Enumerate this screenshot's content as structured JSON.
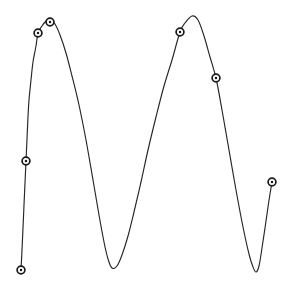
{
  "chart_data": {
    "type": "line",
    "title": "",
    "subtitle": "",
    "xlabel": "",
    "ylabel": "",
    "xlim": [
      0,
      294
    ],
    "ylim": [
      0,
      289
    ],
    "grid": false,
    "axes_visible": false,
    "tick_labels_x": [],
    "tick_labels_y": [],
    "legend": [],
    "legend_position": "none",
    "annotations": [],
    "series": [
      {
        "name": "waveform",
        "color": "#262626",
        "line_width": 1.15,
        "marker_shape": "circle-ring",
        "marker_size": 5,
        "points": [
          {
            "x": 21,
            "y": 270
          },
          {
            "x": 22,
            "y": 250
          },
          {
            "x": 23,
            "y": 228
          },
          {
            "x": 24,
            "y": 205
          },
          {
            "x": 25,
            "y": 183
          },
          {
            "x": 26,
            "y": 161
          },
          {
            "x": 27,
            "y": 139
          },
          {
            "x": 28,
            "y": 117
          },
          {
            "x": 29,
            "y": 100
          },
          {
            "x": 31,
            "y": 80
          },
          {
            "x": 33,
            "y": 62
          },
          {
            "x": 36,
            "y": 46
          },
          {
            "x": 38,
            "y": 33
          },
          {
            "x": 42,
            "y": 26
          },
          {
            "x": 46,
            "y": 21
          },
          {
            "x": 50,
            "y": 19
          },
          {
            "x": 55,
            "y": 24
          },
          {
            "x": 60,
            "y": 35
          },
          {
            "x": 66,
            "y": 53
          },
          {
            "x": 72,
            "y": 76
          },
          {
            "x": 79,
            "y": 105
          },
          {
            "x": 86,
            "y": 140
          },
          {
            "x": 93,
            "y": 180
          },
          {
            "x": 99,
            "y": 215
          },
          {
            "x": 104,
            "y": 242
          },
          {
            "x": 108,
            "y": 259
          },
          {
            "x": 112,
            "y": 268
          },
          {
            "x": 117,
            "y": 266
          },
          {
            "x": 122,
            "y": 255
          },
          {
            "x": 128,
            "y": 236
          },
          {
            "x": 134,
            "y": 212
          },
          {
            "x": 141,
            "y": 182
          },
          {
            "x": 148,
            "y": 150
          },
          {
            "x": 156,
            "y": 117
          },
          {
            "x": 164,
            "y": 86
          },
          {
            "x": 172,
            "y": 60
          },
          {
            "x": 180,
            "y": 32
          },
          {
            "x": 185,
            "y": 23
          },
          {
            "x": 192,
            "y": 16
          },
          {
            "x": 198,
            "y": 20
          },
          {
            "x": 204,
            "y": 36
          },
          {
            "x": 210,
            "y": 57
          },
          {
            "x": 216,
            "y": 78
          },
          {
            "x": 222,
            "y": 110
          },
          {
            "x": 229,
            "y": 150
          },
          {
            "x": 236,
            "y": 190
          },
          {
            "x": 243,
            "y": 227
          },
          {
            "x": 249,
            "y": 254
          },
          {
            "x": 253,
            "y": 267
          },
          {
            "x": 256,
            "y": 272
          },
          {
            "x": 259,
            "y": 266
          },
          {
            "x": 262,
            "y": 248
          },
          {
            "x": 265,
            "y": 228
          },
          {
            "x": 268,
            "y": 207
          },
          {
            "x": 270,
            "y": 194
          },
          {
            "x": 272,
            "y": 182
          }
        ],
        "markers": [
          {
            "index": 0,
            "x": 21,
            "y": 270,
            "label": "start-point"
          },
          {
            "index": 1,
            "x": 26,
            "y": 161,
            "label": "left-rise-point"
          },
          {
            "index": 2,
            "x": 38,
            "y": 33,
            "label": "first-peak-shoulder"
          },
          {
            "index": 3,
            "x": 50,
            "y": 22,
            "label": "first-peak-apex"
          },
          {
            "index": 4,
            "x": 180,
            "y": 32,
            "label": "second-peak-shoulder"
          },
          {
            "index": 5,
            "x": 216,
            "y": 78,
            "label": "second-peak-descent"
          },
          {
            "index": 6,
            "x": 272,
            "y": 182,
            "label": "end-point"
          }
        ]
      }
    ],
    "colors": {
      "line": "#262626",
      "marker_stroke": "#1a1a1a",
      "marker_fill": "#ffffff",
      "background": "#ffffff"
    }
  }
}
